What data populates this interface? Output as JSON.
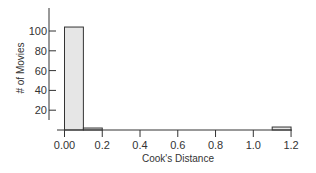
{
  "chart_data": {
    "type": "bar",
    "subtype": "histogram",
    "title": "",
    "xlabel": "Cook's Distance",
    "ylabel": "# of Movies",
    "bin_width": 0.1,
    "bins": [
      {
        "start": 0.0,
        "end": 0.1,
        "count": 104
      },
      {
        "start": 0.1,
        "end": 0.2,
        "count": 2
      },
      {
        "start": 0.2,
        "end": 0.3,
        "count": 0
      },
      {
        "start": 0.3,
        "end": 0.4,
        "count": 0
      },
      {
        "start": 0.4,
        "end": 0.5,
        "count": 0
      },
      {
        "start": 0.5,
        "end": 0.6,
        "count": 0
      },
      {
        "start": 0.6,
        "end": 0.7,
        "count": 0
      },
      {
        "start": 0.7,
        "end": 0.8,
        "count": 0
      },
      {
        "start": 0.8,
        "end": 0.9,
        "count": 0
      },
      {
        "start": 0.9,
        "end": 1.0,
        "count": 0
      },
      {
        "start": 1.0,
        "end": 1.1,
        "count": 0
      },
      {
        "start": 1.1,
        "end": 1.2,
        "count": 3
      }
    ],
    "x_ticks": [
      "0.00",
      "0.2",
      "0.4",
      "0.6",
      "0.8",
      "1.0",
      "1.2"
    ],
    "y_ticks": [
      "20",
      "40",
      "60",
      "80",
      "100"
    ],
    "xlim": [
      0,
      1.2
    ],
    "ylim": [
      0,
      120
    ],
    "grid": false,
    "bar_color": "#e6e6e6",
    "edge_color": "#333333"
  }
}
